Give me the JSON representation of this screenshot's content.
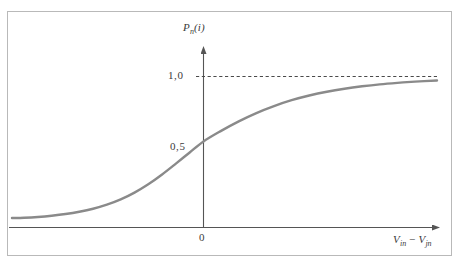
{
  "figure": {
    "background_color": "#ffffff",
    "frame_color": "#b9b9b9",
    "curve_color": "#8a8a8a",
    "axis_color": "#555555",
    "dash_color": "#4a4a4a",
    "text_color": "#3a3a3a"
  },
  "chart_data": {
    "type": "line",
    "title": "",
    "subtitle": "",
    "xlabel": "V_in - V_jn",
    "xlabel_parts": {
      "v1": "V",
      "v1_sub": "in",
      "operator": "−",
      "v2": "V",
      "v2_sub": "jn"
    },
    "ylabel": "P_n(i)",
    "ylabel_parts": {
      "p": "P",
      "p_sub": "n",
      "arg_open": "(",
      "arg": "i",
      "arg_close": ")"
    },
    "xticks": [
      0
    ],
    "xticklabels": [
      "0"
    ],
    "yticks": [
      0.5,
      1.0
    ],
    "yticklabels": [
      "0,5",
      "1,0"
    ],
    "xlim": [
      -5.55,
      5.3
    ],
    "ylim": [
      -0.07,
      1.15
    ],
    "grid": false,
    "legend": null,
    "annotations": [
      {
        "kind": "horizontal-asymptote",
        "value": 1.0,
        "style": "dashed",
        "label": "1,0"
      },
      {
        "kind": "midpoint",
        "x": 0,
        "y": 0.5,
        "label": "0,5"
      }
    ],
    "series": [
      {
        "name": "logistic",
        "description": "sigmoid / logistic probability curve P_n(i) versus V_in - V_jn",
        "x": [
          -5.55,
          -5.2,
          -4.8,
          -4.4,
          -4.0,
          -3.6,
          -3.2,
          -2.8,
          -2.4,
          -2.0,
          -1.6,
          -1.2,
          -0.8,
          -0.4,
          0.0,
          0.4,
          0.8,
          1.2,
          1.6,
          2.0,
          2.4,
          2.8,
          3.2,
          3.6,
          4.0,
          4.4,
          4.8,
          5.3
        ],
        "y": [
          0.063,
          0.065,
          0.07,
          0.078,
          0.089,
          0.104,
          0.124,
          0.151,
          0.186,
          0.231,
          0.286,
          0.351,
          0.423,
          0.497,
          0.57,
          0.64,
          0.703,
          0.758,
          0.804,
          0.843,
          0.874,
          0.899,
          0.919,
          0.935,
          0.948,
          0.958,
          0.966,
          0.974
        ]
      }
    ]
  }
}
